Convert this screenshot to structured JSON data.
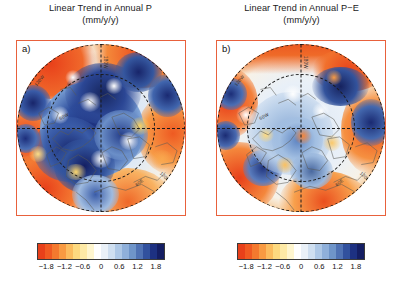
{
  "figure": {
    "width": 402,
    "height": 288,
    "background": "#ffffff",
    "frame_color": "#e8613c"
  },
  "panels": [
    {
      "label": "a)",
      "title_line1": "Linear Trend in Annual P",
      "title_line2": "(mm/y/y)",
      "lon_labels": [
        "120W",
        "60W",
        "180W",
        "60E",
        "120E"
      ],
      "colorbar": {
        "ticks": [
          "-1.8",
          "-1.2",
          "-0.6",
          "0",
          "0.6",
          "1.2",
          "1.8"
        ],
        "tick_values": [
          -1.8,
          -1.2,
          -0.6,
          0,
          0.6,
          1.2,
          1.8
        ],
        "vmin": -2.1,
        "vmax": 2.1,
        "colors": [
          "#e8401a",
          "#f05a22",
          "#f4792e",
          "#f89a42",
          "#fbbc5e",
          "#fdd97f",
          "#feeaa6",
          "#fff6cf",
          "#ffffff",
          "#eaf1f8",
          "#cfdff0",
          "#aec8e6",
          "#8fb0da",
          "#6f95c9",
          "#4f72b4",
          "#31519e",
          "#1d3182",
          "#141e63"
        ]
      }
    },
    {
      "label": "b)",
      "title_line1": "Linear Trend in Annual P−E",
      "title_line2": "(mm/y/y)",
      "lon_labels": [
        "120W",
        "60W",
        "180W",
        "60E",
        "120E"
      ],
      "colorbar": {
        "ticks": [
          "-1.8",
          "-1.2",
          "-0.6",
          "0",
          "0.6",
          "1.2",
          "1.8"
        ],
        "tick_values": [
          -1.8,
          -1.2,
          -0.6,
          0,
          0.6,
          1.2,
          1.8
        ],
        "vmin": -2.1,
        "vmax": 2.1,
        "colors": [
          "#e8401a",
          "#f05a22",
          "#f4792e",
          "#f89a42",
          "#fbbc5e",
          "#fdd97f",
          "#feeaa6",
          "#fff6cf",
          "#ffffff",
          "#eaf1f8",
          "#cfdff0",
          "#aec8e6",
          "#8fb0da",
          "#6f95c9",
          "#4f72b4",
          "#31519e",
          "#1d3182",
          "#141e63"
        ]
      }
    }
  ],
  "chart_data": {
    "type": "heatmap",
    "projection": "north polar stereographic",
    "units": "mm/y/y",
    "colormap": "RdYlBu (red negative to blue positive)",
    "colorbar_ticks": [
      -1.8,
      -1.2,
      -0.6,
      0,
      0.6,
      1.2,
      1.8
    ],
    "value_range": [
      -2.1,
      2.1
    ],
    "grid": "dashed latitude circles and meridians",
    "legend": "shared horizontal colorbar below each panel",
    "panels": [
      {
        "id": "a",
        "variable": "P",
        "label": "Linear Trend in Annual P (mm/y/y)",
        "description": "Strong positive (blue) trends over the Arctic Ocean and high-latitude Eurasia/North America; ring of negative (red) trends at mid-latitudes",
        "regions": [
          {
            "name": "Arctic Ocean / North Pole",
            "value": 1.4
          },
          {
            "name": "Greenland",
            "value": 0.9
          },
          {
            "name": "northern Canada",
            "value": 1.6
          },
          {
            "name": "Siberia",
            "value": 0.8
          },
          {
            "name": "North Atlantic mid-latitudes",
            "value": -1.7
          },
          {
            "name": "North Pacific mid-latitudes",
            "value": -1.5
          },
          {
            "name": "Mediterranean / central Asia",
            "value": -1.2
          },
          {
            "name": "Bering Sea",
            "value": 1.9
          },
          {
            "name": "Scandinavia",
            "value": 0.6
          }
        ]
      },
      {
        "id": "b",
        "variable": "P-E",
        "label": "Linear Trend in Annual P−E (mm/y/y)",
        "description": "Weaker, patchier positive trends over the central Arctic; broad negative band at mid-latitudes, stronger than in panel a",
        "regions": [
          {
            "name": "Arctic Ocean / North Pole",
            "value": 0.6
          },
          {
            "name": "Greenland",
            "value": 0.4
          },
          {
            "name": "northern Canada",
            "value": 1.2
          },
          {
            "name": "Siberia",
            "value": 0.3
          },
          {
            "name": "North Atlantic mid-latitudes",
            "value": -1.9
          },
          {
            "name": "North Pacific mid-latitudes",
            "value": -1.8
          },
          {
            "name": "Mediterranean / central Asia",
            "value": -1.4
          },
          {
            "name": "Bering Sea",
            "value": 1.5
          },
          {
            "name": "Scandinavia",
            "value": -0.4
          }
        ]
      }
    ]
  }
}
